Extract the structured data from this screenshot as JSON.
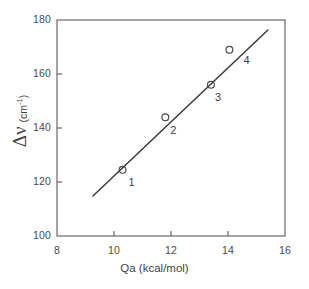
{
  "chart_data": {
    "type": "scatter",
    "title": "",
    "xlabel": "Qa (kcal/mol)",
    "ylabel_main": "Δν",
    "ylabel_units": "(cm",
    "ylabel_units_sup": "-1",
    "ylabel_units_tail": ")",
    "xlim": [
      8,
      16
    ],
    "ylim": [
      100,
      180
    ],
    "xticks": [
      8,
      10,
      12,
      14,
      16
    ],
    "yticks": [
      100,
      120,
      140,
      160,
      180
    ],
    "xtick_labels": [
      "8",
      "10",
      "12",
      "14",
      "16"
    ],
    "ytick_labels": [
      "100",
      "120",
      "140",
      "160",
      "180"
    ],
    "grid": false,
    "legend": false,
    "marker": "open-circle",
    "points": [
      {
        "label": "1",
        "x": 10.3,
        "y": 124.5
      },
      {
        "label": "2",
        "x": 11.8,
        "y": 144.0
      },
      {
        "label": "3",
        "x": 13.4,
        "y": 156.0
      },
      {
        "label": "4",
        "x": 14.05,
        "y": 169.0
      }
    ],
    "fit_line": {
      "x0": 9.26,
      "y0": 114.8,
      "x1": 15.4,
      "y1": 176.3
    },
    "colors": {
      "axis": "#5a5a5a",
      "line": "#3a3a3a",
      "marker": "#4a4a4a",
      "text": "#3f3f3f",
      "background": "#ffffff"
    }
  }
}
